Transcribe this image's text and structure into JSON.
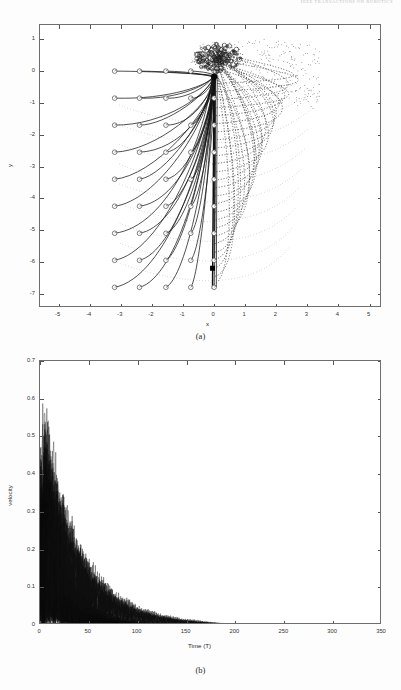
{
  "document": {
    "running_head": "IEEE TRANSACTIONS ON ROBOTICS"
  },
  "figure": {
    "panels": [
      {
        "caption": "(a)"
      },
      {
        "caption": "(b)"
      }
    ]
  },
  "chart_data": [
    {
      "type": "scatter",
      "panel": "(a)",
      "title": "",
      "xlabel": "x",
      "ylabel": "y",
      "xlim": [
        -5.6,
        5.4
      ],
      "ylim": [
        -7.45,
        1.45
      ],
      "xticks": [
        -5,
        -4,
        -3,
        -2,
        -1,
        0,
        1,
        2,
        3,
        4,
        5
      ],
      "yticks": [
        1,
        0,
        -1,
        -2,
        -3,
        -4,
        -5,
        -6,
        -7
      ],
      "grid": false,
      "legend": null,
      "annotations": [
        "circle markers = initial agent positions (grid)",
        "filled square marker = goal / leader target",
        "solid curves = agent trajectories",
        "dotted curves = alternate/predicted trajectories"
      ],
      "markers": {
        "start_marker": {
          "shape": "circle-open",
          "size": 4.6,
          "color": "#555555"
        },
        "goal_marker": {
          "shape": "square-filled",
          "size": 5.0,
          "color": "#000000",
          "x": -0.05,
          "y": -6.2
        },
        "convergence_point": {
          "x": 0.0,
          "y": -0.18
        }
      },
      "start_grid": {
        "x": [
          -3.2,
          -2.4,
          -1.55,
          -0.75,
          0.0
        ],
        "y": [
          0.0,
          -0.85,
          -1.7,
          -2.55,
          -3.4,
          -4.25,
          -5.1,
          -5.95,
          -6.8
        ]
      },
      "dotted_arc_extent": {
        "x_max": 3.5,
        "y_min": -6.9,
        "y_max": 1.15
      }
    },
    {
      "type": "line",
      "panel": "(b)",
      "title": "",
      "xlabel": "Time (T)",
      "ylabel": "velocity",
      "xlim": [
        0,
        350
      ],
      "ylim": [
        0,
        0.7
      ],
      "xticks": [
        0,
        50,
        100,
        150,
        200,
        250,
        300,
        350
      ],
      "yticks": [
        0,
        0.1,
        0.2,
        0.3,
        0.4,
        0.5,
        0.6,
        0.7
      ],
      "grid": false,
      "legend": null,
      "series_count": 45,
      "description": "Many overlaid agent velocity traces, oscillating and decaying to zero",
      "peak_velocity": 0.58,
      "peak_time": 4,
      "settling_time": 170,
      "annotations": [
        "all velocities converge to 0 by T ~ 170"
      ]
    }
  ]
}
